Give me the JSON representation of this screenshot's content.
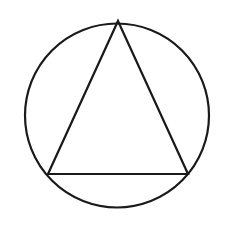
{
  "canvas": {
    "width": 238,
    "height": 228,
    "background_color": "#ffffff"
  },
  "figure": {
    "stroke_color": "#1a1a1a",
    "fill_color": "none"
  },
  "shapes": [
    {
      "name": "circle",
      "type": "circle",
      "cx": 117,
      "cy": 115.5,
      "r": 92,
      "stroke_width": 2.2,
      "stroke_color": "#1a1a1a",
      "fill": "none"
    },
    {
      "name": "triangle",
      "type": "polygon",
      "points": "118,21 188,174 48,174",
      "vertices": [
        {
          "label": "apex",
          "x": 118,
          "y": 21
        },
        {
          "label": "base-right",
          "x": 188,
          "y": 174
        },
        {
          "label": "base-left",
          "x": 48,
          "y": 174
        }
      ],
      "stroke_width": 2.2,
      "stroke_color": "#1a1a1a",
      "fill": "none"
    }
  ]
}
